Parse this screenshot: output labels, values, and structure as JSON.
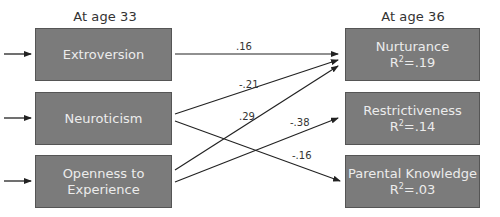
{
  "headers": {
    "left": "At age 33",
    "right": "At age 36"
  },
  "predictors": [
    {
      "label": "Extroversion"
    },
    {
      "label": "Neuroticism"
    },
    {
      "label": "Openness to",
      "label2": "Experience"
    }
  ],
  "outcomes": [
    {
      "label": "Nurturance",
      "r2_prefix": "R",
      "r2_sup": "2",
      "r2_value": "=.19"
    },
    {
      "label": "Restrictiveness",
      "r2_prefix": "R",
      "r2_sup": "2",
      "r2_value": "=.14"
    },
    {
      "label": "Parental Knowledge",
      "r2_prefix": "R",
      "r2_sup": "2",
      "r2_value": "=.03"
    }
  ],
  "paths": [
    {
      "from": "Extroversion",
      "to": "Nurturance",
      "coefficient": ".16"
    },
    {
      "from": "Neuroticism",
      "to": "Nurturance",
      "coefficient": "-.21"
    },
    {
      "from": "Openness to Experience",
      "to": "Nurturance",
      "coefficient": ".29"
    },
    {
      "from": "Openness to Experience",
      "to": "Restrictiveness",
      "coefficient": "-.38"
    },
    {
      "from": "Neuroticism",
      "to": "Parental Knowledge",
      "coefficient": "-.16"
    }
  ],
  "colors": {
    "box_fill": "#7b7b7b",
    "box_border": "#555555",
    "box_text": "#ececec",
    "line": "#222222"
  }
}
